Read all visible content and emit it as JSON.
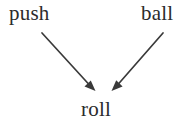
{
  "diagram": {
    "type": "directed-graph",
    "canvas": {
      "width": 193,
      "height": 124,
      "background": "#ffffff"
    },
    "text_color": "#2b2b2b",
    "edge_color": "#3a3a3a",
    "nodes": [
      {
        "id": "push",
        "label": "push",
        "x": 36,
        "y": 14,
        "role": "source"
      },
      {
        "id": "ball",
        "label": "ball",
        "x": 163,
        "y": 14,
        "role": "source"
      },
      {
        "id": "roll",
        "label": "roll",
        "x": 99,
        "y": 110,
        "role": "target"
      }
    ],
    "edges": [
      {
        "id": "push-to-roll",
        "from": "push",
        "to": "roll",
        "arrowhead": "filled-triangle",
        "label": ""
      },
      {
        "id": "ball-to-roll",
        "from": "ball",
        "to": "roll",
        "arrowhead": "filled-triangle",
        "label": ""
      }
    ]
  }
}
